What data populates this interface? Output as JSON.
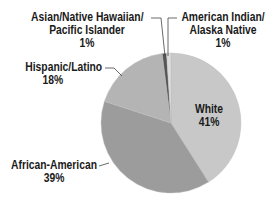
{
  "chart_data": {
    "type": "pie",
    "title": "",
    "start_angle_deg": 0,
    "direction": "clockwise",
    "slices": [
      {
        "name": "White",
        "label_lines": [
          "White"
        ],
        "value": 41,
        "value_label": "41%",
        "color": "#c8c8c8"
      },
      {
        "name": "African-American",
        "label_lines": [
          "African-American"
        ],
        "value": 39,
        "value_label": "39%",
        "color": "#9c9c9c"
      },
      {
        "name": "Hispanic/Latino",
        "label_lines": [
          "Hispanic/Latino"
        ],
        "value": 18,
        "value_label": "18%",
        "color": "#b4b4b4"
      },
      {
        "name": "Asian/Native Hawaiian/Pacific Islander",
        "label_lines": [
          "Asian/Native Hawaiian/",
          "Pacific Islander"
        ],
        "value": 1,
        "value_label": "1%",
        "color": "#555555"
      },
      {
        "name": "American Indian/Alaska Native",
        "label_lines": [
          "American Indian/",
          "Alaska Native"
        ],
        "value": 1,
        "value_label": "1%",
        "color": "#dcdcdc"
      }
    ],
    "legend": "none (direct labels with leader lines)"
  },
  "labels": {
    "asian": {
      "line1": "Asian/Native Hawaiian/",
      "line2": "Pacific Islander",
      "pct": "1%"
    },
    "american_indian": {
      "line1": "American Indian/",
      "line2": "Alaska Native",
      "pct": "1%"
    },
    "hispanic": {
      "line1": "Hispanic/Latino",
      "pct": "18%"
    },
    "african_american": {
      "line1": "African-American",
      "pct": "39%"
    },
    "white": {
      "line1": "White",
      "pct": "41%"
    }
  }
}
